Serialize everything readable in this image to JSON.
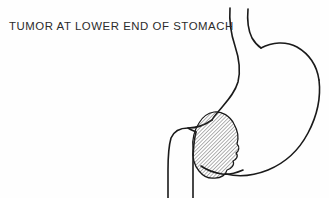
{
  "figure": {
    "domain": "diagram",
    "kind": "medical-line-illustration",
    "caption": "TUMOR AT LOWER END OF STOMACH",
    "width": 329,
    "height": 198,
    "background_color": "#fefefe",
    "stroke_color": "#1a1a1a",
    "caption_color": "#2b2b2b",
    "hatch_color": "#4a4a4a",
    "parts": [
      {
        "name": "esophagus",
        "label": "Esophagus",
        "description": "Two roughly parallel vertical lines entering from the top of the image, descending and curving slightly as they approach the stomach."
      },
      {
        "name": "fundus",
        "label": "Fundus",
        "description": "Rounded dome at the upper right of the stomach body."
      },
      {
        "name": "lesser-curvature",
        "label": "Lesser curvature",
        "description": "Left / inner outline of the stomach descending from the esophagus toward the pylorus."
      },
      {
        "name": "greater-curvature",
        "label": "Greater curvature",
        "description": "Large outer sweep on the right side of the stomach curving down and to the left toward the pylorus."
      },
      {
        "name": "pylorus",
        "label": "Pylorus",
        "description": "Narrowed lower end of the stomach where it joins the duodenum; a small notch is visible."
      },
      {
        "name": "duodenum",
        "label": "Duodenum",
        "description": "Two near-vertical lines running from the pylorus down to the bottom edge of the image."
      },
      {
        "name": "tumor",
        "label": "Tumor",
        "description": "Irregular lobulated mass with fine diagonal hatching located at the lower end of the stomach near the pylorus."
      }
    ],
    "tumor": {
      "fill_style": "diagonal-hatch",
      "hatch_angle_degrees": 45,
      "hatch_spacing_px": 2,
      "outline": "irregular lobulated",
      "center_x": 215,
      "center_y": 148,
      "approx_width": 48,
      "approx_height": 62
    }
  }
}
